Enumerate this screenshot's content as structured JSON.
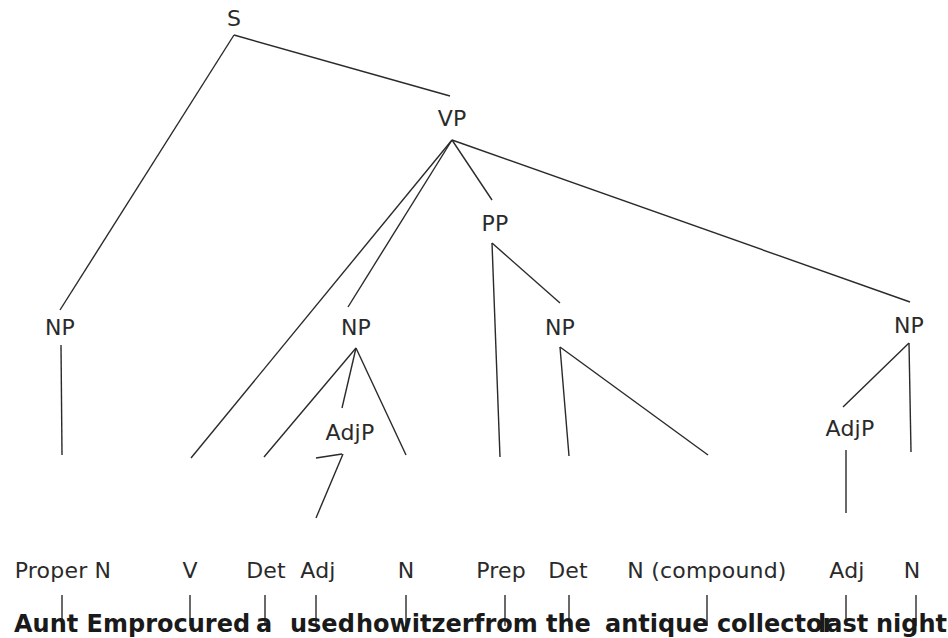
{
  "diagram": {
    "type": "syntax-tree",
    "nodes": {
      "s": "S",
      "vp": "VP",
      "pp": "PP",
      "np_subject": "NP",
      "np_object": "NP",
      "np_pp": "NP",
      "np_time": "NP",
      "adjp_object": "AdjP",
      "adjp_time": "AdjP"
    },
    "preterminals": [
      "Proper N",
      "V",
      "Det",
      "Adj",
      "N",
      "Prep",
      "Det",
      "N (compound)",
      "Adj",
      "N"
    ],
    "words": [
      "Aunt Em",
      "procured",
      "a",
      "used",
      "howitzer",
      "from",
      "the",
      "antique collector",
      "last",
      "night"
    ],
    "sentence": "Aunt Em procured a used howitzer from the antique collector last night",
    "line_color": "#2a2a2a"
  }
}
